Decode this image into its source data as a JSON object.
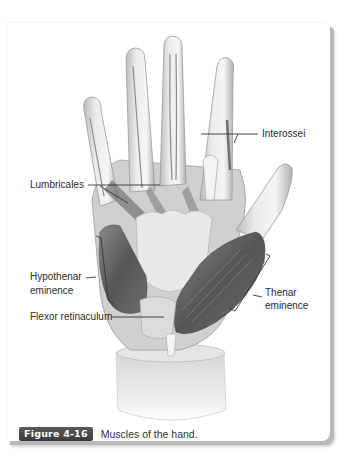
{
  "figure": {
    "number_badge": "Figure 4-16",
    "caption": "Muscles of the hand.",
    "colors": {
      "badge_bg": "#444444",
      "badge_text": "#ffffff",
      "label_text": "#2b2b2b",
      "leader_line": "#333333",
      "muscle_dark": "#5e5e5e",
      "tendon_light": "#e4e4e4",
      "shadow": "#b9b9b9"
    }
  },
  "labels": {
    "interossei": "Interossei",
    "lumbricales": "Lumbricales",
    "hypothenar_line1": "Hypothenar",
    "hypothenar_line2": "eminence",
    "flexor_retinaculum": "Flexor retinaculum",
    "thenar_line1": "Thenar",
    "thenar_line2": "eminence"
  }
}
